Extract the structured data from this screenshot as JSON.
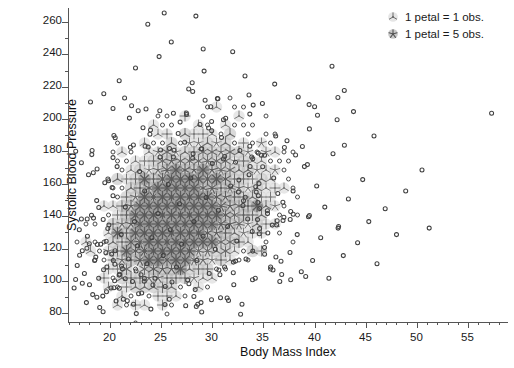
{
  "chart_data": {
    "type": "scatter",
    "title": "",
    "xlabel": "Body Mass Index",
    "ylabel": "Systolic Blood Pressure",
    "xlim": [
      16.0,
      59.0
    ],
    "ylim": [
      74.0,
      268.0
    ],
    "xticks": [
      20,
      25,
      30,
      35,
      40,
      45,
      50,
      55
    ],
    "xticklabels": [
      "20",
      "25",
      "30",
      "35",
      "40",
      "45",
      "50",
      "55"
    ],
    "xtick_minor_step": 1,
    "yticks": [
      80,
      100,
      120,
      140,
      160,
      180,
      200,
      220,
      240,
      260
    ],
    "yticklabels": [
      "80",
      "100",
      "120",
      "140",
      "160",
      "180",
      "200",
      "220",
      "240",
      "260"
    ],
    "ytick_minor_step": 10,
    "grid": false,
    "legend_position": "top-right",
    "legend": [
      {
        "glyph": "sunflower-1-petal-icon",
        "label": "1 petal = 1 obs.",
        "petals": 3,
        "weight": 1
      },
      {
        "glyph": "sunflower-5-petal-icon",
        "label": "1 petal = 5 obs.",
        "petals": 5,
        "weight": 5
      }
    ],
    "marker": {
      "single_obs": "open-circle",
      "single_obs_radius_px": 2.0,
      "single_obs_stroke": "#4a4a4a",
      "multi_obs": "sunflower",
      "multi_obs_stroke": "#6e6e6e",
      "multi_obs_fill": "#b9b9b9"
    },
    "series": [
      {
        "name": "Single observations (1 obs.)",
        "marker": "open-circle",
        "points": [
          [
            17.1,
            131
          ],
          [
            17.4,
            118
          ],
          [
            17.6,
            104
          ],
          [
            17.9,
            127
          ],
          [
            18.1,
            97
          ],
          [
            18.3,
            140
          ],
          [
            18.6,
            112
          ],
          [
            18.8,
            149
          ],
          [
            19.0,
            101
          ],
          [
            19.2,
            122
          ],
          [
            19.4,
            90
          ],
          [
            19.6,
            160
          ],
          [
            19.8,
            108
          ],
          [
            20.0,
            134
          ],
          [
            20.2,
            95
          ],
          [
            20.4,
            152
          ],
          [
            20.6,
            118
          ],
          [
            20.8,
            170
          ],
          [
            21.0,
            103
          ],
          [
            21.2,
            128
          ],
          [
            21.4,
            88
          ],
          [
            21.6,
            145
          ],
          [
            21.9,
            113
          ],
          [
            22.1,
            182
          ],
          [
            22.3,
            99
          ],
          [
            22.5,
            136
          ],
          [
            22.8,
            121
          ],
          [
            23.0,
            167
          ],
          [
            23.2,
            92
          ],
          [
            23.5,
            155
          ],
          [
            23.7,
            110
          ],
          [
            24.0,
            190
          ],
          [
            24.2,
            126
          ],
          [
            24.5,
            101
          ],
          [
            24.8,
            141
          ],
          [
            25.0,
            176
          ],
          [
            25.3,
            115
          ],
          [
            25.5,
            96
          ],
          [
            25.8,
            159
          ],
          [
            26.0,
            131
          ],
          [
            26.3,
            203
          ],
          [
            26.6,
            108
          ],
          [
            26.9,
            147
          ],
          [
            27.1,
            122
          ],
          [
            27.4,
            185
          ],
          [
            27.7,
            100
          ],
          [
            28.0,
            163
          ],
          [
            28.3,
            136
          ],
          [
            28.6,
            112
          ],
          [
            28.9,
            196
          ],
          [
            29.2,
            127
          ],
          [
            29.5,
            151
          ],
          [
            29.8,
            104
          ],
          [
            30.1,
            172
          ],
          [
            30.4,
            119
          ],
          [
            30.7,
            143
          ],
          [
            31.0,
            188
          ],
          [
            31.3,
            108
          ],
          [
            31.6,
            133
          ],
          [
            31.9,
            158
          ],
          [
            32.2,
            97
          ],
          [
            32.5,
            124
          ],
          [
            32.8,
            180
          ],
          [
            33.1,
            146
          ],
          [
            33.4,
            113
          ],
          [
            33.7,
            165
          ],
          [
            34.0,
            130
          ],
          [
            34.3,
            101
          ],
          [
            34.6,
            152
          ],
          [
            34.9,
            177
          ],
          [
            35.2,
            120
          ],
          [
            35.5,
            141
          ],
          [
            35.8,
            108
          ],
          [
            36.1,
            163
          ],
          [
            36.4,
            134
          ],
          [
            36.7,
            99
          ],
          [
            37.0,
            148
          ],
          [
            37.4,
            186
          ],
          [
            37.7,
            117
          ],
          [
            38.0,
            155
          ],
          [
            38.4,
            128
          ],
          [
            38.8,
            105
          ],
          [
            39.1,
            170
          ],
          [
            39.5,
            139
          ],
          [
            39.9,
            112
          ],
          [
            40.3,
            158
          ],
          [
            40.7,
            126
          ],
          [
            41.1,
            145
          ],
          [
            41.5,
            101
          ],
          [
            41.9,
            178
          ],
          [
            42.4,
            132
          ],
          [
            42.9,
            115
          ],
          [
            43.4,
            150
          ],
          [
            43.9,
            204
          ],
          [
            44.3,
            123
          ],
          [
            44.8,
            162
          ],
          [
            45.4,
            136
          ],
          [
            46.2,
            110
          ],
          [
            47.0,
            144
          ],
          [
            48.1,
            128
          ],
          [
            49.0,
            155
          ],
          [
            50.6,
            168
          ],
          [
            51.3,
            132
          ],
          [
            57.4,
            203
          ],
          [
            19.5,
            215
          ],
          [
            21.0,
            223
          ],
          [
            22.6,
            231
          ],
          [
            23.8,
            258
          ],
          [
            24.9,
            238
          ],
          [
            26.1,
            247
          ],
          [
            27.8,
            218
          ],
          [
            29.3,
            229
          ],
          [
            30.6,
            212
          ],
          [
            32.1,
            241
          ],
          [
            33.3,
            226
          ],
          [
            35.0,
            209
          ],
          [
            36.2,
            221
          ],
          [
            38.5,
            213
          ],
          [
            40.1,
            207
          ],
          [
            41.8,
            232
          ],
          [
            43.0,
            217
          ],
          [
            28.5,
            263
          ],
          [
            25.4,
            265
          ],
          [
            18.2,
            210
          ],
          [
            20.4,
            206
          ],
          [
            22.0,
            200
          ],
          [
            31.2,
            199
          ],
          [
            34.1,
            208
          ],
          [
            17.8,
            86
          ],
          [
            19.1,
            83
          ],
          [
            20.7,
            87
          ],
          [
            22.4,
            85
          ],
          [
            24.1,
            82
          ],
          [
            25.9,
            88
          ],
          [
            27.5,
            84
          ],
          [
            29.0,
            86
          ],
          [
            30.9,
            89
          ],
          [
            33.0,
            85
          ],
          [
            16.9,
            109
          ],
          [
            16.6,
            95
          ],
          [
            18.0,
            165
          ],
          [
            45.9,
            189
          ]
        ]
      }
    ],
    "density_bins": {
      "description": "Overplotted sunflower glyph cells, center (bmi, sbp) with observation count encoding petal number",
      "center": [
        26.5,
        138
      ],
      "x_extent": [
        19.0,
        34.0
      ],
      "y_extent": [
        96,
        200
      ],
      "peak_region": [
        [
          24.0,
          29.0
        ],
        [
          120,
          150
        ]
      ]
    }
  }
}
